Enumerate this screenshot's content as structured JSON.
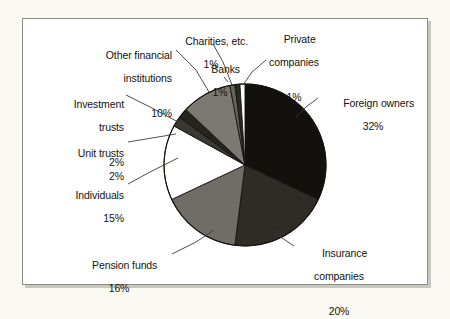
{
  "figure": {
    "background_color": "#ffffff",
    "page_background_color": "#fbfaf2",
    "border_color": "#8d8d86"
  },
  "chart_data": {
    "type": "pie",
    "title": "",
    "subtitle": "",
    "xlabel": "",
    "ylabel": "",
    "legend_position": "callout-labels",
    "grid": false,
    "units": "percent",
    "total": 100,
    "start_angle_deg": 0,
    "direction": "clockwise",
    "categories": [
      "Foreign owners",
      "Insurance companies",
      "Pension funds",
      "Individuals",
      "Unit trusts",
      "Investment trusts",
      "Other financial institutions",
      "Charities, etc.",
      "Banks",
      "Private companies"
    ],
    "values": [
      32,
      20,
      16,
      15,
      2,
      2,
      10,
      1,
      1,
      1
    ],
    "value_labels": [
      "32%",
      "20%",
      "16%",
      "15%",
      "2%",
      "2%",
      "10%",
      "1%",
      "1%",
      "1%"
    ],
    "colors": [
      "#13110e",
      "#2f2c26",
      "#6f6d66",
      "#ffffff",
      "#3a3833",
      "#26241f",
      "#7b7972",
      "#66645d",
      "#2b2924",
      "#ffffff"
    ],
    "slices": [
      {
        "label": "Foreign owners",
        "value": 32,
        "value_label": "32%",
        "color": "#13110e"
      },
      {
        "label": "Insurance companies",
        "value": 20,
        "value_label": "20%",
        "color": "#2f2c26"
      },
      {
        "label": "Pension funds",
        "value": 16,
        "value_label": "16%",
        "color": "#6f6d66"
      },
      {
        "label": "Individuals",
        "value": 15,
        "value_label": "15%",
        "color": "#ffffff"
      },
      {
        "label": "Unit trusts",
        "value": 2,
        "value_label": "2%",
        "color": "#3a3833"
      },
      {
        "label": "Investment trusts",
        "value": 2,
        "value_label": "2%",
        "color": "#26241f"
      },
      {
        "label": "Other financial institutions",
        "value": 10,
        "value_label": "10%",
        "color": "#7b7972"
      },
      {
        "label": "Charities, etc.",
        "value": 1,
        "value_label": "1%",
        "color": "#66645d"
      },
      {
        "label": "Banks",
        "value": 1,
        "value_label": "1%",
        "color": "#2b2924"
      },
      {
        "label": "Private companies",
        "value": 1,
        "value_label": "1%",
        "color": "#ffffff"
      }
    ]
  },
  "labels": {
    "foreign_owners": {
      "name": "Foreign owners",
      "pct": "32%"
    },
    "insurance": {
      "name": "Insurance",
      "name2": "companies",
      "pct": "20%"
    },
    "pension_funds": {
      "name": "Pension funds",
      "pct": "16%"
    },
    "individuals": {
      "name": "Individuals",
      "pct": "15%"
    },
    "unit_trusts": {
      "name": "Unit trusts",
      "pct": "2%"
    },
    "investment_trusts": {
      "name": "Investment",
      "name2": "trusts",
      "pct": "2%"
    },
    "other_financial": {
      "name": "Other financial",
      "name2": "institutions",
      "pct": "10%"
    },
    "charities": {
      "name": "Charities, etc.",
      "pct": "1%"
    },
    "banks": {
      "name": "Banks",
      "pct": "1%"
    },
    "private_companies": {
      "name": "Private",
      "name2": "companies",
      "pct": "1%"
    }
  }
}
